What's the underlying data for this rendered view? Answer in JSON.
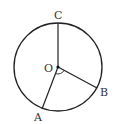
{
  "diagram": {
    "type": "circle-geometry",
    "circle": {
      "center": "O",
      "cx": 58,
      "cy": 67,
      "r": 44
    },
    "points": [
      {
        "name": "C",
        "x": 58,
        "y": 23,
        "label_x": 54,
        "label_y": 19
      },
      {
        "name": "O",
        "x": 58,
        "y": 67,
        "label_x": 44,
        "label_y": 72
      },
      {
        "name": "A",
        "x": 42,
        "y": 109,
        "label_x": 34,
        "label_y": 121
      },
      {
        "name": "B",
        "x": 97,
        "y": 88,
        "label_x": 100,
        "label_y": 96
      }
    ],
    "segments": [
      "OC",
      "OA",
      "OB"
    ],
    "angle_mark": {
      "vertex": "O",
      "between": [
        "A",
        "B"
      ]
    },
    "colors": {
      "stroke": "#222222",
      "label": "#333333"
    }
  },
  "labels": {
    "C": "C",
    "O": "O",
    "A": "A",
    "B": "B"
  }
}
